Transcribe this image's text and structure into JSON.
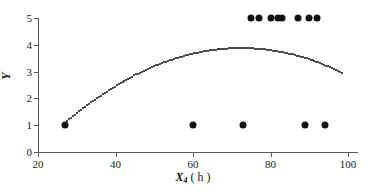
{
  "chart_data": {
    "type": "scatter",
    "title": "",
    "xlabel": "X₄ ( h )",
    "xlabel_var": "X",
    "xlabel_sub": "4",
    "xlabel_unit": "( h )",
    "ylabel": "Y",
    "xlim": [
      20,
      100
    ],
    "ylim": [
      0,
      5
    ],
    "xticks": [
      20,
      40,
      60,
      80,
      100
    ],
    "yticks": [
      0,
      1,
      2,
      3,
      4,
      5
    ],
    "xtick_labels": [
      "20",
      "40",
      "60",
      "80",
      "100"
    ],
    "ytick_labels": [
      "0",
      "1",
      "2",
      "3",
      "4",
      "5"
    ],
    "grid": false,
    "legend": null,
    "marker_color": "#111111",
    "axis_color": "#5a5a5a",
    "background_color": "#ffffff",
    "series": [
      {
        "name": "observations-y1",
        "marker": "filled-circle",
        "points": [
          {
            "x": 27,
            "y": 1
          },
          {
            "x": 60,
            "y": 1
          },
          {
            "x": 73,
            "y": 1
          },
          {
            "x": 89,
            "y": 1
          },
          {
            "x": 94,
            "y": 1
          }
        ]
      },
      {
        "name": "observations-y5",
        "marker": "filled-circle",
        "points": [
          {
            "x": 75,
            "y": 5
          },
          {
            "x": 77,
            "y": 5
          },
          {
            "x": 80,
            "y": 5
          },
          {
            "x": 82,
            "y": 5
          },
          {
            "x": 83,
            "y": 5
          },
          {
            "x": 87,
            "y": 5
          },
          {
            "x": 90,
            "y": 5
          },
          {
            "x": 92,
            "y": 5
          }
        ]
      },
      {
        "name": "fitted-curve",
        "marker": "dotted-line",
        "x_start": 27,
        "x_end": 98.5,
        "quadratic": {
          "a": -0.00135,
          "b": 0.1955,
          "c": -3.2
        },
        "peak": {
          "x": 72,
          "y": 3.85
        },
        "y_start": 0.4,
        "y_end": 3.15
      }
    ]
  }
}
